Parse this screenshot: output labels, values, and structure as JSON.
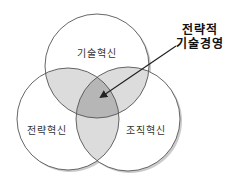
{
  "diagram": {
    "type": "venn-3",
    "circles": [
      {
        "id": "tech",
        "label": "기술혁신",
        "cx": 97,
        "cy": 66,
        "r": 52
      },
      {
        "id": "strategy",
        "label": "전략혁신",
        "cx": 68,
        "cy": 119,
        "r": 51
      },
      {
        "id": "org",
        "label": "조직혁신",
        "cx": 128,
        "cy": 119,
        "r": 52
      }
    ],
    "center_label": {
      "line1": "전략적",
      "line2": "기술경영"
    },
    "colors": {
      "circle_fill": "#ffffff",
      "circle_stroke": "#555555",
      "pair_overlap": "#dcdcdc",
      "center_overlap": "#b6b6b6",
      "arrow": "#222222",
      "shadow": "#9a9a9a"
    },
    "arrow": {
      "x1": 176,
      "y1": 46,
      "x2": 99,
      "y2": 98
    }
  }
}
